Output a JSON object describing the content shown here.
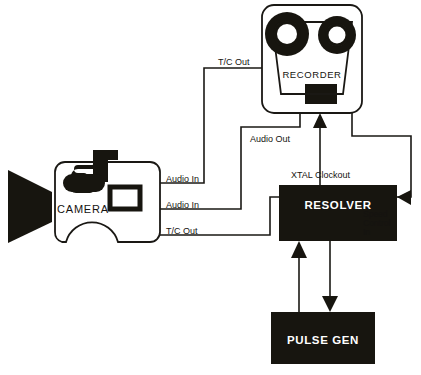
{
  "diagram": {
    "background_color": "#ffffff",
    "ink_color": "#17150f"
  },
  "nodes": {
    "camera": {
      "label": "CAMERA",
      "type": "camera-icon"
    },
    "recorder": {
      "label": "RECORDER",
      "type": "reel-recorder-icon"
    },
    "resolver": {
      "label": "RESOLVER",
      "type": "black-box",
      "fill": "#17150f",
      "text_color": "#ffffff"
    },
    "pulse_gen": {
      "label": "PULSE GEN",
      "type": "black-box",
      "fill": "#17150f",
      "text_color": "#ffffff"
    }
  },
  "connections": [
    {
      "id": "tc-out-top",
      "label": "T/C Out",
      "from": "recorder",
      "to": "camera"
    },
    {
      "id": "audio-out",
      "label": "Audio Out",
      "from": "recorder",
      "to": "camera"
    },
    {
      "id": "audio-in-upper",
      "label": "Audio In",
      "from": "recorder",
      "to": "camera"
    },
    {
      "id": "audio-in-lower",
      "label": "Audio In",
      "from": "recorder",
      "to": "camera"
    },
    {
      "id": "tc-out-camera",
      "label": "T/C Out",
      "from": "camera",
      "to": "resolver"
    },
    {
      "id": "xtal-clockout",
      "label": "XTAL Clockout",
      "from": "resolver",
      "to": "recorder"
    },
    {
      "id": "speed-control-in",
      "label": "Speed Control In",
      "from": "recorder",
      "to": "resolver"
    }
  ],
  "labels": {
    "tc_out_top": "T/C Out",
    "audio_out": "Audio Out",
    "audio_in_upper": "Audio In",
    "audio_in_lower": "Audio In",
    "tc_out_camera": "T/C Out",
    "xtal_clockout": "XTAL Clockout",
    "speed_control_line1": "Speed",
    "speed_control_line2": "Control",
    "speed_control_line3": "In"
  }
}
